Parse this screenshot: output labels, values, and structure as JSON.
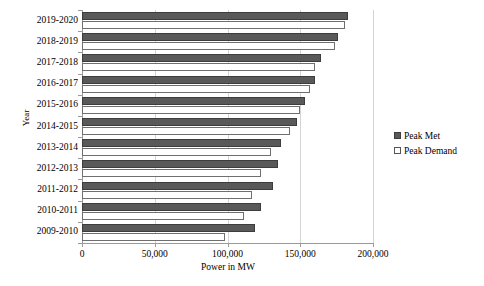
{
  "chart_data": {
    "type": "bar",
    "orientation": "horizontal",
    "title": "",
    "xlabel": "Power in MW",
    "ylabel": "Year",
    "categories": [
      "2019-2020",
      "2018-2019",
      "2017-2018",
      "2016-2017",
      "2015-2016",
      "2014-2015",
      "2013-2014",
      "2012-2013",
      "2011-2012",
      "2010-2011",
      "2009-2010"
    ],
    "series": [
      {
        "name": "Peak Met",
        "values": [
          183000,
          176000,
          164000,
          160000,
          153000,
          148000,
          137000,
          135000,
          131000,
          123000,
          119000
        ]
      },
      {
        "name": "Peak Demand",
        "values": [
          181000,
          174000,
          160000,
          157000,
          150000,
          143000,
          130000,
          123000,
          117000,
          111000,
          98000
        ]
      }
    ],
    "xlim": [
      0,
      200000
    ],
    "xticks": [
      0,
      50000,
      100000,
      150000,
      200000
    ],
    "xticklabels": [
      "0",
      "50,000",
      "100,000",
      "150,000",
      "200,000"
    ],
    "grid": true,
    "grid_axis": "x",
    "legend_position": "right",
    "colors": {
      "peak_met": "#595959",
      "peak_demand": "#ffffff",
      "gridline": "#d4d4d4",
      "axis": "#9a9a9a"
    }
  },
  "legend": {
    "items": [
      {
        "label": "Peak Met",
        "swatch": "filled-pattern-square"
      },
      {
        "label": "Peak Demand",
        "swatch": "open-square"
      }
    ]
  }
}
